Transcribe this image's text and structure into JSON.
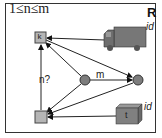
{
  "diagram": {
    "title": "1≤n≤m",
    "corner_label": "R",
    "nodes": {
      "k_box": {
        "label": "k"
      },
      "bottom_box": {
        "label": ""
      },
      "truck": {
        "label": "id",
        "icon": "truck-icon"
      },
      "crate": {
        "label": "t",
        "id_label": "id",
        "icon": "box-icon"
      },
      "circle_left": {
        "label": ""
      },
      "circle_right": {
        "label": ""
      }
    },
    "edge_labels": {
      "circle_edge": "m",
      "vertical_edge": "n?"
    },
    "colors": {
      "node_fill": "#8a8a8a",
      "box_fill": "#b5b5b5",
      "line": "#222222",
      "truck_fill": "#7a7a7a"
    }
  }
}
